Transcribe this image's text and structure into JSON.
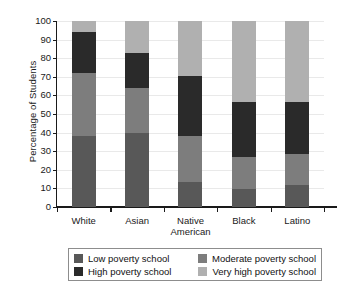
{
  "chart_data": {
    "type": "bar",
    "subtype": "stacked-bar-100-percent",
    "title": "",
    "xlabel": "",
    "ylabel": "Percentage of Students",
    "ylim": [
      0,
      100
    ],
    "ytick_step": 10,
    "yticks": [
      0,
      10,
      20,
      30,
      40,
      50,
      60,
      70,
      80,
      90,
      100
    ],
    "ytick_labels": [
      "0",
      "10",
      "20",
      "30",
      "40",
      "50",
      "60",
      "70",
      "80",
      "90",
      "100"
    ],
    "grid": true,
    "grid_axis": "y",
    "legend_position": "bottom",
    "categories": [
      "White",
      "Asian",
      "Native American",
      "Black",
      "Latino"
    ],
    "category_labels_display": [
      "White",
      "Asian",
      "Native\nAmerican",
      "Black",
      "Latino"
    ],
    "series": [
      {
        "name": "Low poverty school",
        "color": "#585858",
        "values": [
          38,
          40,
          13.5,
          9.5,
          12
        ]
      },
      {
        "name": "Moderate poverty school",
        "color": "#7d7d7d",
        "values": [
          34,
          24,
          24.5,
          17.5,
          16.5
        ]
      },
      {
        "name": "High poverty school",
        "color": "#2a2a2a",
        "values": [
          22,
          19,
          32.5,
          29.5,
          28
        ]
      },
      {
        "name": "Very high poverty school",
        "color": "#b0b0b0",
        "values": [
          6,
          17,
          29.5,
          43.5,
          43.5
        ]
      }
    ],
    "cumulative_tops": {
      "White": [
        38,
        72,
        94,
        100
      ],
      "Asian": [
        40,
        64,
        83,
        100
      ],
      "Native American": [
        13.5,
        38,
        70.5,
        100
      ],
      "Black": [
        9.5,
        27,
        56.5,
        100
      ],
      "Latino": [
        12,
        28.5,
        56.5,
        100
      ]
    }
  },
  "legend": {
    "entries": [
      {
        "label": "Low poverty school",
        "color": "#585858"
      },
      {
        "label": "Moderate poverty school",
        "color": "#7d7d7d"
      },
      {
        "label": "High poverty school",
        "color": "#2a2a2a"
      },
      {
        "label": "Very high poverty school",
        "color": "#b0b0b0"
      }
    ]
  },
  "colors": {
    "axis": "#1a1a1a",
    "grid": "#e9e9e9",
    "background": "#ffffff",
    "legend_border": "#8d8d8d"
  }
}
